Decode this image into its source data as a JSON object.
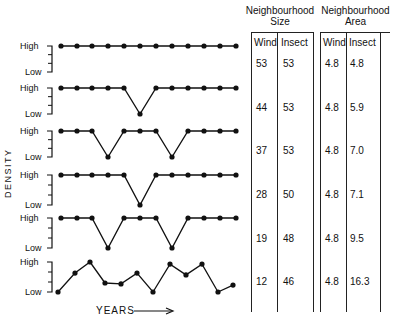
{
  "chart_data": {
    "type": "line",
    "title": "",
    "xlabel": "YEARS",
    "ylabel": "DENSITY",
    "y_tick_labels": [
      "High",
      "Low"
    ],
    "panels": [
      {
        "name": "panel-1",
        "values": [
          1,
          1,
          1,
          1,
          1,
          1,
          1,
          1,
          1,
          1,
          1,
          1
        ]
      },
      {
        "name": "panel-2",
        "values": [
          1,
          1,
          1,
          1,
          1,
          0,
          1,
          1,
          1,
          1,
          1,
          1
        ]
      },
      {
        "name": "panel-3",
        "values": [
          1,
          1,
          1,
          0,
          1,
          1,
          1,
          0,
          1,
          1,
          1,
          1
        ]
      },
      {
        "name": "panel-4",
        "values": [
          1,
          1,
          1,
          1,
          1,
          0,
          1,
          1,
          1,
          1,
          1,
          1
        ]
      },
      {
        "name": "panel-5",
        "values": [
          1,
          1,
          1,
          0,
          1,
          1,
          1,
          0,
          1,
          1,
          1,
          1
        ]
      },
      {
        "name": "panel-6",
        "values": [
          0.0,
          0.63,
          1.0,
          0.3,
          0.27,
          0.63,
          0.0,
          0.93,
          0.57,
          0.93,
          0.0,
          0.23
        ]
      }
    ],
    "table": {
      "groups": [
        "Neighbourhood Size",
        "Neighbourhood Area"
      ],
      "columns": [
        "Wind",
        "Insect",
        "Wind",
        "Insect"
      ],
      "rows": [
        [
          53,
          53,
          4.8,
          4.8
        ],
        [
          44,
          53,
          4.8,
          5.9
        ],
        [
          37,
          53,
          4.8,
          7.0
        ],
        [
          28,
          50,
          4.8,
          7.1
        ],
        [
          19,
          48,
          4.8,
          9.5
        ],
        [
          12,
          46,
          4.8,
          16.3
        ]
      ]
    }
  },
  "labels": {
    "high": "High",
    "low": "Low",
    "density": "DENSITY",
    "years": "YEARS"
  },
  "table": {
    "size_title_1": "Neighbourhood",
    "size_title_2": "Size",
    "area_title_1": "Neighbourhood",
    "area_title_2": "Area",
    "col_wind": "Wind",
    "col_insect": "Insect",
    "rows": [
      {
        "sw": "53",
        "si": "53",
        "aw": "4.8",
        "ai": "4.8"
      },
      {
        "sw": "44",
        "si": "53",
        "aw": "4.8",
        "ai": "5.9"
      },
      {
        "sw": "37",
        "si": "53",
        "aw": "4.8",
        "ai": "7.0"
      },
      {
        "sw": "28",
        "si": "50",
        "aw": "4.8",
        "ai": "7.1"
      },
      {
        "sw": "19",
        "si": "48",
        "aw": "4.8",
        "ai": "9.5"
      },
      {
        "sw": "12",
        "si": "46",
        "aw": "4.8",
        "ai": "16.3"
      }
    ]
  }
}
